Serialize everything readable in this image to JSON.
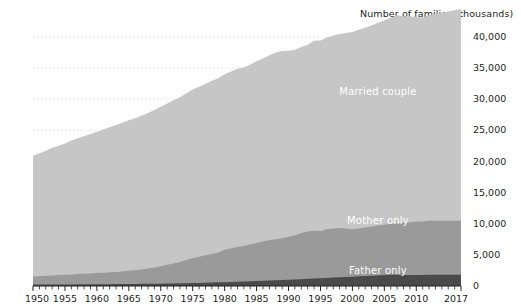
{
  "chart_data": {
    "type": "area",
    "stacked": true,
    "title": "",
    "subtitle": "",
    "axis_note": "Number of families (thousands)",
    "xlabel": "",
    "ylabel": "Number of families (thousands)",
    "xlim": [
      1950,
      2017
    ],
    "ylim": [
      0,
      40000
    ],
    "ytick_labels": [
      "40,000",
      "35,000",
      "30,000",
      "25,000",
      "20,000",
      "15,000",
      "10,000",
      "5,000",
      "0"
    ],
    "ytick_values": [
      40000,
      35000,
      30000,
      25000,
      20000,
      15000,
      10000,
      5000,
      0
    ],
    "xtick_labels": [
      "1950",
      "1955",
      "1960",
      "1965",
      "1970",
      "1975",
      "1980",
      "1985",
      "1990",
      "1995",
      "2000",
      "2005",
      "2010",
      "2017"
    ],
    "xtick_values": [
      1950,
      1955,
      1960,
      1965,
      1970,
      1975,
      1980,
      1985,
      1990,
      1995,
      2000,
      2005,
      2010,
      2017
    ],
    "minor_ticks": "every year",
    "grid": "horizontal dashed light gray",
    "legend_position": "inline labels on bands",
    "colors": {
      "married_couple": "#c6c6c6",
      "mother_only": "#9a9a9a",
      "father_only": "#4a4a4a",
      "text": "#231f20",
      "label_text": "#ffffff",
      "grid": "#dddddd",
      "axis": "#231f20"
    },
    "x": [
      1950,
      1951,
      1952,
      1953,
      1954,
      1955,
      1956,
      1957,
      1958,
      1959,
      1960,
      1961,
      1962,
      1963,
      1964,
      1965,
      1966,
      1967,
      1968,
      1969,
      1970,
      1971,
      1972,
      1973,
      1974,
      1975,
      1976,
      1977,
      1978,
      1979,
      1980,
      1981,
      1982,
      1983,
      1984,
      1985,
      1986,
      1987,
      1988,
      1989,
      1990,
      1991,
      1992,
      1993,
      1994,
      1995,
      1996,
      1997,
      1998,
      1999,
      2000,
      2001,
      2002,
      2003,
      2004,
      2005,
      2006,
      2007,
      2008,
      2009,
      2010,
      2011,
      2012,
      2013,
      2014,
      2015,
      2016,
      2017
    ],
    "series": [
      {
        "name": "Married couple",
        "label": "Married couple",
        "color": "#c6c6c6",
        "label_x": 2004,
        "label_y": 31000,
        "values": [
          19400,
          19700,
          20100,
          20500,
          20800,
          21100,
          21500,
          21800,
          22100,
          22400,
          22700,
          23000,
          23300,
          23600,
          23900,
          24200,
          24400,
          24700,
          25000,
          25300,
          25600,
          25900,
          26200,
          26500,
          26800,
          27100,
          27300,
          27500,
          27800,
          28000,
          28200,
          28400,
          28600,
          28700,
          28900,
          29200,
          29400,
          29700,
          30000,
          30100,
          29900,
          29800,
          29900,
          30000,
          30500,
          30600,
          30800,
          31000,
          31200,
          31400,
          31700,
          31900,
          32100,
          32300,
          32600,
          32800,
          33100,
          33400,
          33200,
          33100,
          32900,
          32800,
          33000,
          33200,
          33400,
          33600,
          33800,
          34000
        ]
      },
      {
        "name": "Mother only",
        "label": "Mother only",
        "color": "#9a9a9a",
        "label_x": 2004,
        "label_y": 10300,
        "values": [
          1300,
          1350,
          1400,
          1450,
          1500,
          1550,
          1600,
          1650,
          1700,
          1750,
          1800,
          1850,
          1900,
          1950,
          2000,
          2100,
          2200,
          2300,
          2450,
          2600,
          2800,
          3000,
          3200,
          3400,
          3700,
          4000,
          4200,
          4400,
          4600,
          4800,
          5200,
          5400,
          5600,
          5700,
          5900,
          6100,
          6300,
          6500,
          6600,
          6700,
          6900,
          7100,
          7400,
          7600,
          7700,
          7600,
          7800,
          7900,
          7900,
          7800,
          7600,
          7700,
          7800,
          7900,
          8000,
          8100,
          8200,
          8300,
          8400,
          8500,
          8600,
          8600,
          8700,
          8700,
          8700,
          8700,
          8700,
          8700
        ]
      },
      {
        "name": "Father only",
        "label": "Father only",
        "color": "#4a4a4a",
        "label_x": 2004,
        "label_y": 2300,
        "values": [
          230,
          235,
          240,
          245,
          250,
          255,
          260,
          265,
          270,
          275,
          280,
          290,
          300,
          310,
          320,
          330,
          340,
          350,
          360,
          370,
          380,
          400,
          420,
          440,
          460,
          480,
          500,
          530,
          560,
          590,
          620,
          650,
          680,
          720,
          760,
          800,
          840,
          880,
          920,
          960,
          1000,
          1050,
          1100,
          1150,
          1200,
          1250,
          1300,
          1350,
          1400,
          1450,
          1500,
          1550,
          1600,
          1650,
          1700,
          1750,
          1800,
          1800,
          1750,
          1750,
          1750,
          1750,
          1800,
          1800,
          1800,
          1800,
          1800,
          1800
        ]
      }
    ]
  }
}
